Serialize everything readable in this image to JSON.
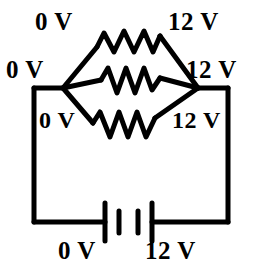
{
  "figure": {
    "type": "circuit-diagram",
    "width": 254,
    "height": 274,
    "stroke_color": "#000000",
    "background_color": "#ffffff"
  },
  "labels": {
    "top_left": "0 V",
    "top_right": "12 V",
    "middle_left": "0 V",
    "middle_right": "12 V",
    "lower_left": "0 V",
    "lower_right": "12 V",
    "bottom_left": "0 V",
    "bottom_right": "12 V"
  },
  "components": {
    "resistor_top": "resistor-zigzag-top",
    "resistor_middle": "resistor-zigzag-middle",
    "resistor_bottom": "resistor-zigzag-bottom",
    "battery": "battery-cell-symbol",
    "node_left": "junction-node-left",
    "node_right": "junction-node-right",
    "wire_left": "wire-left-vertical",
    "wire_right": "wire-right-vertical",
    "wire_bottom": "wire-bottom-horizontal"
  }
}
